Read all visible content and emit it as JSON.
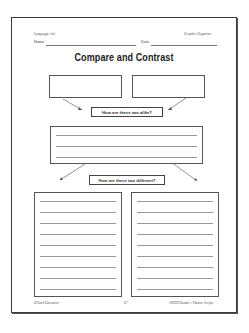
{
  "header": {
    "subject": "Language Arts",
    "type": "Graphic Organizer",
    "name_label": "Name",
    "date_label": "Date"
  },
  "title": "Compare and Contrast",
  "prompts": {
    "alike": "How are these two alike?",
    "different": "How are these two different?"
  },
  "boxes": {
    "item_one_lines": 0,
    "item_two_lines": 0,
    "alike_lines": 3,
    "different_left_lines": 9,
    "different_right_lines": 9
  },
  "footer": {
    "publisher": "Dillard Education",
    "page_number": "67",
    "series": "#XXXX Reader's Theater Scripts"
  }
}
